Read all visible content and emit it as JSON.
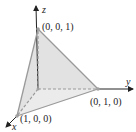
{
  "diagram": {
    "type": "3d-coordinate-plane-tetrahedron",
    "axes": {
      "x_label": "x",
      "y_label": "y",
      "z_label": "z"
    },
    "points": {
      "x_intercept": "(1, 0, 0)",
      "y_intercept": "(0, 1, 0)",
      "z_intercept": "(0, 0, 1)"
    },
    "colors": {
      "axis": "#222222",
      "face_fill": "#e2e2e2",
      "edge": "#9a9a9a",
      "hidden_edge": "#9a9a9a",
      "vertex_dot": "#a0a0a0"
    }
  }
}
